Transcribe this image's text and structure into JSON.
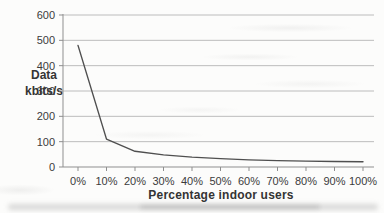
{
  "chart_data": {
    "type": "line",
    "title": "",
    "categories": [
      "0%",
      "10%",
      "20%",
      "30%",
      "40%",
      "50%",
      "60%",
      "70%",
      "80%",
      "90%",
      "100%"
    ],
    "values": [
      480,
      110,
      62,
      48,
      39,
      33,
      28,
      25,
      23,
      22,
      21
    ],
    "xlabel": "Percentage indoor users",
    "ylabel": "Data kbits/s",
    "ylabel_lines": [
      "Data",
      "kbits/s"
    ],
    "ylim": [
      0,
      600
    ],
    "yticks": [
      0,
      100,
      200,
      300,
      400,
      500,
      600
    ],
    "grid": "horizontal",
    "legend_position": "none",
    "colors": {
      "line": "#4f4f4f",
      "gridline": "#bcbcbc",
      "axis": "#8f8f8f",
      "text": "#3b3b3b"
    }
  }
}
